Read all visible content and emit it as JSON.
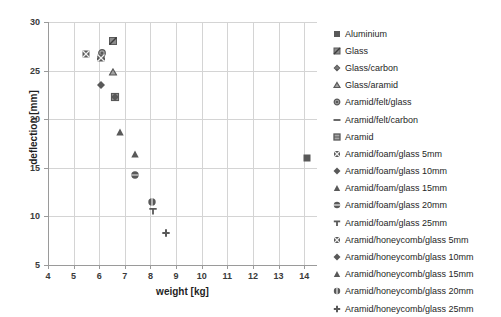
{
  "chart_data": {
    "type": "scatter",
    "title": "",
    "xlabel": "weight [kg]",
    "ylabel": "deflection [mm]",
    "xlim": [
      4,
      14.5
    ],
    "ylim": [
      5,
      30
    ],
    "xticks": [
      "4",
      "5",
      "6",
      "7",
      "8",
      "9",
      "10",
      "11",
      "12",
      "13",
      "14"
    ],
    "yticks": [
      "5",
      "10",
      "15",
      "20",
      "25",
      "30"
    ],
    "grid": true,
    "legend_position": "right",
    "marker_color": "#595959",
    "series": [
      {
        "name": "Aluminium",
        "marker": "square-filled",
        "x": 14.1,
        "y": 16.0
      },
      {
        "name": "Glass",
        "marker": "square-hatched",
        "x": 6.52,
        "y": 28.0
      },
      {
        "name": "Glass/carbon",
        "marker": "diamond-small",
        "x": 6.08,
        "y": 26.35
      },
      {
        "name": "Glass/aramid",
        "marker": "triangle-open",
        "x": 6.55,
        "y": 24.85
      },
      {
        "name": "Aramid/felt/glass",
        "marker": "circle-dot",
        "x": 6.1,
        "y": 26.85
      },
      {
        "name": "Aramid/felt/carbon",
        "marker": "dash",
        "x": 6.08,
        "y": 26.2
      },
      {
        "name": "Aramid",
        "marker": "square-outline",
        "x": 6.62,
        "y": 22.25
      },
      {
        "name": "Aramid/foam/glass 5mm",
        "marker": "square-crossed",
        "x": 5.48,
        "y": 26.75
      },
      {
        "name": "Aramid/foam/glass 10mm",
        "marker": "diamond-filled",
        "x": 6.08,
        "y": 23.5
      },
      {
        "name": "Aramid/foam/glass 15mm",
        "marker": "triangle-filled",
        "x": 6.8,
        "y": 18.65
      },
      {
        "name": "Aramid/foam/glass 20mm",
        "marker": "circle-bar",
        "x": 7.38,
        "y": 14.25
      },
      {
        "name": "Aramid/foam/glass 25mm",
        "marker": "tee",
        "x": 8.08,
        "y": 10.55
      },
      {
        "name": "Aramid/honeycomb/glass 5mm",
        "marker": "square-crossed",
        "x": 6.06,
        "y": 26.3
      },
      {
        "name": "Aramid/honeycomb/glass 10mm",
        "marker": "diamond-filled",
        "x": 6.6,
        "y": 22.3
      },
      {
        "name": "Aramid/honeycomb/glass 15mm",
        "marker": "triangle-filled",
        "x": 7.4,
        "y": 16.4
      },
      {
        "name": "Aramid/honeycomb/glass 20mm",
        "marker": "circle-split",
        "x": 8.05,
        "y": 11.5
      },
      {
        "name": "Aramid/honeycomb/glass 25mm",
        "marker": "plus",
        "x": 8.62,
        "y": 8.25
      }
    ],
    "legend_entries": [
      {
        "label": "Aluminium",
        "marker": "square-filled"
      },
      {
        "label": "Glass",
        "marker": "square-hatched"
      },
      {
        "label": "Glass/carbon",
        "marker": "diamond-small"
      },
      {
        "label": "Glass/aramid",
        "marker": "triangle-open"
      },
      {
        "label": "Aramid/felt/glass",
        "marker": "circle-dot"
      },
      {
        "label": "Aramid/felt/carbon",
        "marker": "dash"
      },
      {
        "label": "Aramid",
        "marker": "square-outline"
      },
      {
        "label": "Aramid/foam/glass 5mm",
        "marker": "square-crossed"
      },
      {
        "label": "Aramid/foam/glass 10mm",
        "marker": "diamond-filled"
      },
      {
        "label": "Aramid/foam/glass 15mm",
        "marker": "triangle-filled"
      },
      {
        "label": "Aramid/foam/glass 20mm",
        "marker": "circle-bar"
      },
      {
        "label": "Aramid/foam/glass 25mm",
        "marker": "tee"
      },
      {
        "label": "Aramid/honeycomb/glass 5mm",
        "marker": "square-crossed"
      },
      {
        "label": "Aramid/honeycomb/glass 10mm",
        "marker": "diamond-filled"
      },
      {
        "label": "Aramid/honeycomb/glass 15mm",
        "marker": "triangle-filled"
      },
      {
        "label": "Aramid/honeycomb/glass 20mm",
        "marker": "circle-split"
      },
      {
        "label": "Aramid/honeycomb/glass 25mm",
        "marker": "plus"
      }
    ]
  }
}
